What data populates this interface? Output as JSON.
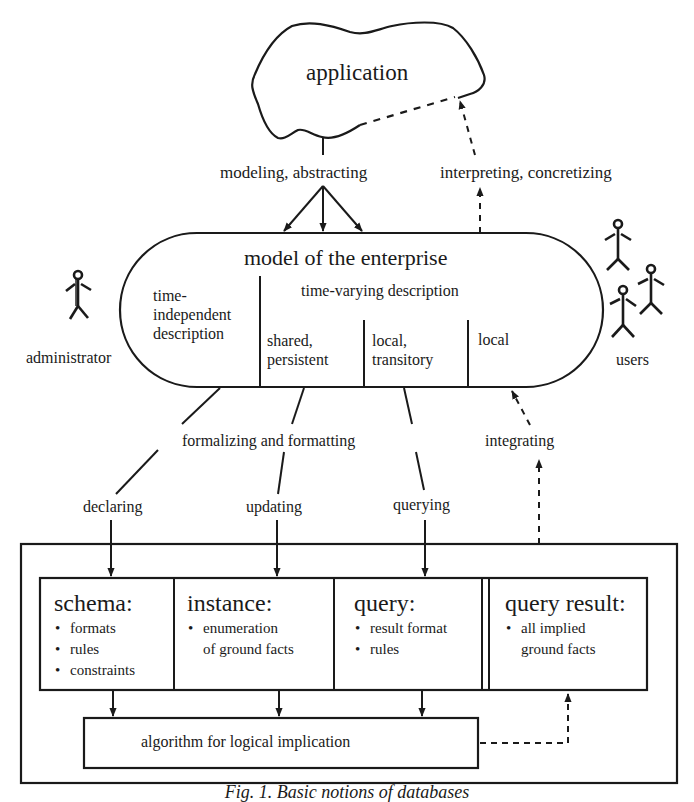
{
  "application": {
    "label": "application"
  },
  "arrows": {
    "modeling": "modeling, abstracting",
    "interpreting": "interpreting, concretizing",
    "formalizing": "formalizing and formatting",
    "integrating": "integrating",
    "declaring": "declaring",
    "updating": "updating",
    "querying": "querying"
  },
  "model": {
    "title": "model of the enterprise",
    "time_independent": [
      "time-",
      "independent",
      "description"
    ],
    "time_varying": "time-varying description",
    "shared": [
      "shared,",
      "persistent"
    ],
    "local_transitory": [
      "local,",
      "transitory"
    ],
    "local": "local"
  },
  "actors": {
    "administrator": "administrator",
    "users": "users"
  },
  "boxes": {
    "schema": {
      "title": "schema:",
      "items": [
        "formats",
        "rules",
        "constraints"
      ]
    },
    "instance": {
      "title": "instance:",
      "items": [
        "enumeration"
      ],
      "continuation": "of ground facts"
    },
    "query": {
      "title": "query:",
      "items": [
        "result format",
        "rules"
      ]
    },
    "query_result": {
      "title": "query result:",
      "items": [
        "all implied"
      ],
      "continuation": "ground facts"
    },
    "algorithm": "algorithm for logical implication"
  },
  "caption": "Fig. 1. Basic notions of databases"
}
